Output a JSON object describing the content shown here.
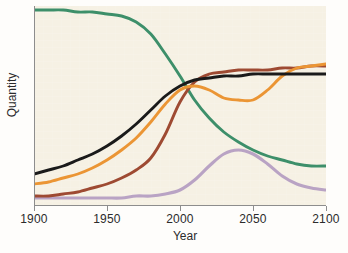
{
  "chart_data": {
    "type": "line",
    "title": "",
    "xlabel": "Year",
    "ylabel": "Quantity",
    "xlim": [
      1900,
      2100
    ],
    "ylim": [
      0,
      100
    ],
    "grid": false,
    "legend": false,
    "legend_position": "none",
    "x_ticks": [
      "1900",
      "1950",
      "2000",
      "2050",
      "2100"
    ],
    "x_tick_values": [
      1900,
      1950,
      2000,
      2050,
      2100
    ],
    "y_ticks": [],
    "background_color": "#f6f1e4",
    "axis_color": "#8d8d8d",
    "x": [
      1900,
      1910,
      1920,
      1930,
      1940,
      1950,
      1960,
      1970,
      1980,
      1990,
      2000,
      2010,
      2020,
      2030,
      2040,
      2050,
      2060,
      2070,
      2080,
      2090,
      2100
    ],
    "series": [
      {
        "name": "green-curve",
        "color": "#3d8f6a",
        "values": [
          98,
          98,
          98,
          97,
          97,
          96,
          95,
          92,
          86,
          76,
          65,
          53,
          44,
          37,
          32,
          28,
          25,
          23,
          21,
          20,
          20
        ]
      },
      {
        "name": "black-curve",
        "color": "#1a1a1a",
        "values": [
          16,
          18,
          20,
          23,
          26,
          30,
          35,
          41,
          48,
          55,
          60,
          63,
          64,
          65,
          65,
          66,
          66,
          66,
          66,
          66,
          66
        ]
      },
      {
        "name": "orange-curve",
        "color": "#eb9534",
        "values": [
          11,
          12,
          14,
          16,
          19,
          23,
          28,
          34,
          42,
          51,
          58,
          60,
          58,
          54,
          53,
          53,
          58,
          65,
          69,
          70,
          71
        ]
      },
      {
        "name": "brown-curve",
        "color": "#9e4a32",
        "values": [
          5,
          5,
          6,
          7,
          9,
          11,
          14,
          18,
          24,
          36,
          52,
          62,
          66,
          67,
          68,
          68,
          68,
          69,
          69,
          70,
          70
        ]
      },
      {
        "name": "purple-curve",
        "color": "#b9a3c4",
        "values": [
          4,
          4,
          4,
          4,
          4,
          4,
          4,
          5,
          5,
          6,
          8,
          13,
          20,
          26,
          28,
          26,
          21,
          15,
          11,
          9,
          8
        ]
      }
    ]
  }
}
